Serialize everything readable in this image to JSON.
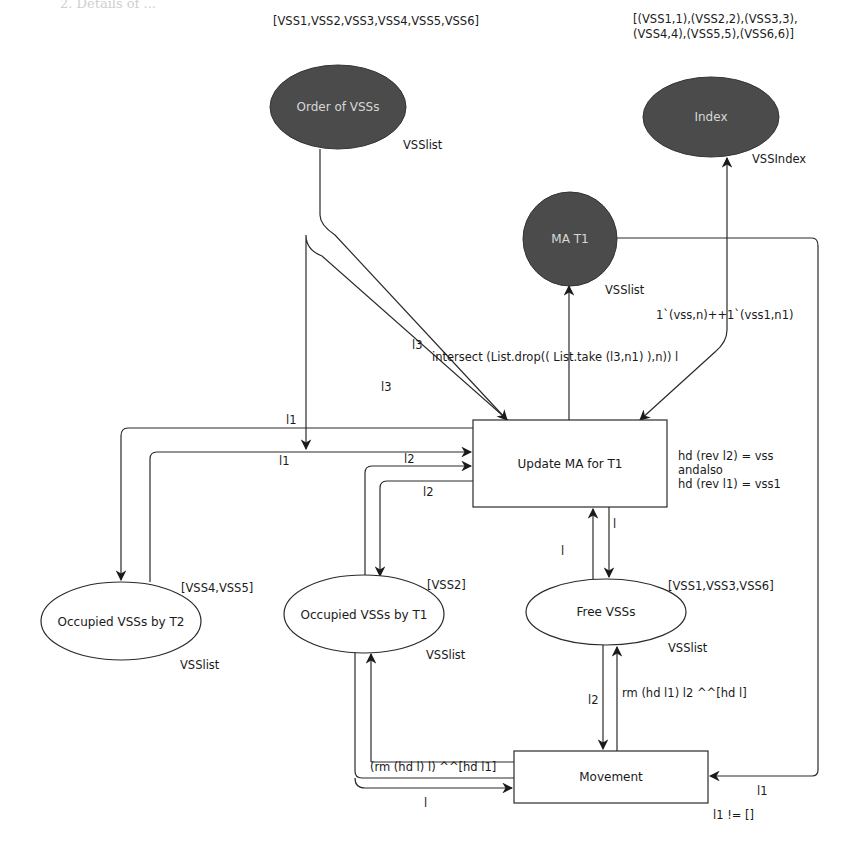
{
  "header": {
    "running_text": "2. Details of ..."
  },
  "places": {
    "order_of_vss": {
      "name": "Order of VSSs",
      "type": "VSSlist",
      "marking": "[VSS1,VSS2,VSS3,VSS4,VSS5,VSS6]",
      "fill": "#4b4b4b"
    },
    "index": {
      "name": "Index",
      "type": "VSSIndex",
      "marking_line1": "[(VSS1,1),(VSS2,2),(VSS3,3),",
      "marking_line2": "(VSS4,4),(VSS5,5),(VSS6,6)]",
      "fill": "#4b4b4b"
    },
    "ma_t1": {
      "name": "MA T1",
      "type": "VSSlist",
      "fill": "#4b4b4b"
    },
    "occupied_t2": {
      "name": "Occupied VSSs by T2",
      "type": "VSSlist",
      "marking": "[VSS4,VSS5]"
    },
    "occupied_t1": {
      "name": "Occupied VSSs by T1",
      "type": "VSSlist",
      "marking": "[VSS2]"
    },
    "free_vss": {
      "name": "Free VSSs",
      "type": "VSSlist",
      "marking": "[VSS1,VSS3,VSS6]"
    }
  },
  "transitions": {
    "update_ma": {
      "name": "Update MA for T1",
      "guard_line1": "hd (rev l2) = vss",
      "guard_line2": "andalso",
      "guard_line3": "hd (rev l1) = vss1"
    },
    "movement": {
      "name": "Movement",
      "guard": "l1 != []"
    }
  },
  "arcs": {
    "order_in": "l3",
    "order_out": "l3",
    "ma_t1_in": "intersect (List.drop(( List.take (l3,n1) ),n)) l",
    "index_arc": "1`(vss,n)++1`(vss1,n1)",
    "t2_out": "l1",
    "t2_in": "l1",
    "t1_in": "l2",
    "t1_out": "l2",
    "free_up": "l",
    "free_down": "l",
    "free_to_move": "l2",
    "move_to_free": "rm (hd l1) l2 ^^[hd l]",
    "move_to_t1": "(rm (hd l) l) ^^[hd l1]",
    "t1_to_move": "l",
    "ma_to_move": "l1"
  }
}
